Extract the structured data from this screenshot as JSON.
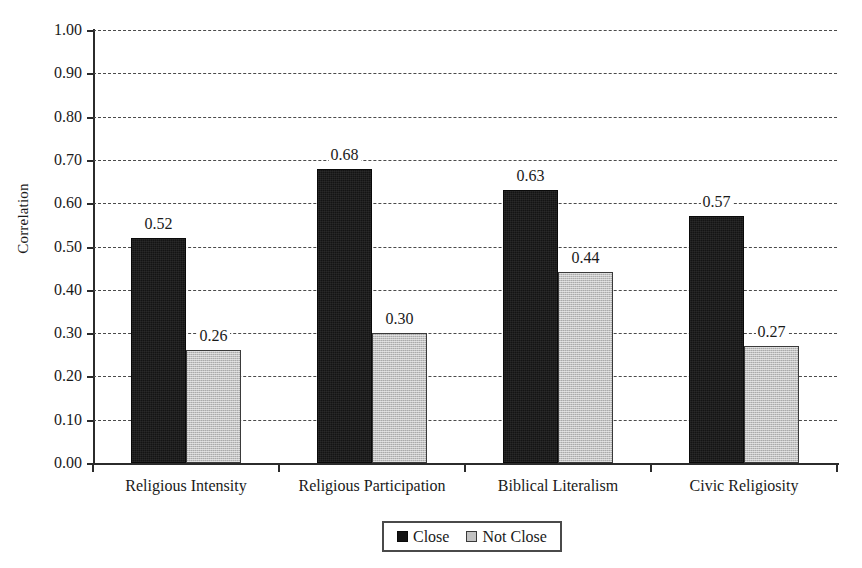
{
  "chart_data": {
    "type": "bar",
    "title": "",
    "xlabel": "",
    "ylabel": "Correlation",
    "ylim": [
      0,
      1.0
    ],
    "ytick_step": 0.1,
    "grid": true,
    "grid_style": "dashed horizontal",
    "legend_position": "bottom-center",
    "categories": [
      "Religious Intensity",
      "Religious Participation",
      "Biblical Literalism",
      "Civic Religiosity"
    ],
    "series": [
      {
        "name": "Close",
        "color": "#141414",
        "values": [
          0.52,
          0.68,
          0.63,
          0.57
        ],
        "labels": [
          "0.52",
          "0.68",
          "0.63",
          "0.57"
        ]
      },
      {
        "name": "Not Close",
        "color": "#c2c2c2",
        "values": [
          0.26,
          0.3,
          0.44,
          0.27
        ],
        "labels": [
          "0.26",
          "0.30",
          "0.44",
          "0.27"
        ]
      }
    ],
    "ytick_labels": [
      "0.00",
      "0.10",
      "0.20",
      "0.30",
      "0.40",
      "0.50",
      "0.60",
      "0.70",
      "0.80",
      "0.90",
      "1.00"
    ],
    "ytick_values": [
      0.0,
      0.1,
      0.2,
      0.3,
      0.4,
      0.5,
      0.6,
      0.7,
      0.8,
      0.9,
      1.0
    ]
  },
  "legend": {
    "items": [
      {
        "label": "Close",
        "swatch": "close"
      },
      {
        "label": "Not Close",
        "swatch": "notclose"
      }
    ]
  },
  "colors": {
    "close": "#141414",
    "not_close": "#c2c2c2",
    "axis": "#2b2b2b",
    "grid": "#4a4a4a",
    "background": "#ffffff",
    "text": "#1a1a1a"
  }
}
